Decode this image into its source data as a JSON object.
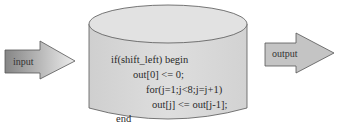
{
  "diagram": {
    "input_arrow": {
      "label": "input"
    },
    "output_arrow": {
      "label": "output"
    },
    "module": {
      "shape": "cylinder",
      "code_lines": [
        "if(shift_left) begin",
        "out[0]  <=  0;",
        "for(j=1;j<8;j=j+1)",
        "out[j] <= out[j-1];",
        "end"
      ]
    },
    "colors": {
      "cylinder_fill": "#d9d9d9",
      "cylinder_top": "#e4e4e4",
      "stroke": "#555555",
      "input_arrow_dark": "#8a8a8a",
      "input_arrow_light": "#e6e6e6",
      "output_arrow_fill": "#c4c4c4"
    }
  }
}
